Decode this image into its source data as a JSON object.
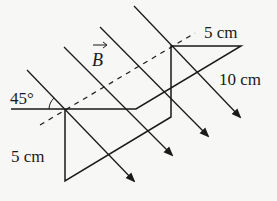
{
  "diagram": {
    "field_symbol": "B",
    "labels": {
      "angle": "45°",
      "top_width": "5 cm",
      "diagonal": "10 cm",
      "left_height": "5 cm"
    },
    "colors": {
      "stroke": "#1a1a1a",
      "background": "#f7f7f5"
    },
    "field_lines": [
      {
        "x1": 27,
        "y1": 70,
        "x2": 134,
        "y2": 181
      },
      {
        "x1": 64,
        "y1": 47,
        "x2": 172,
        "y2": 155
      },
      {
        "x1": 100,
        "y1": 27,
        "x2": 208,
        "y2": 136
      },
      {
        "x1": 134,
        "y1": 6,
        "x2": 240,
        "y2": 117
      }
    ],
    "wire_path": "M 11 109 L 136 109 L 241 46 L 171 46 L 171 117 L 65 181 L 65 110",
    "dashed_axis": {
      "x1": 40,
      "y1": 125,
      "x2": 195,
      "y2": 33
    }
  }
}
